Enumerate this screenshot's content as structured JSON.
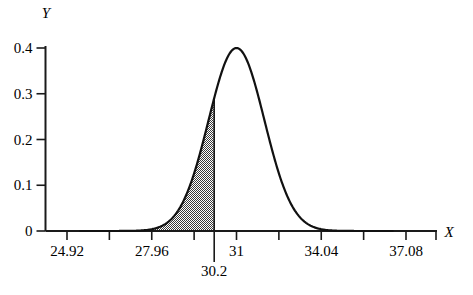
{
  "chart_data": {
    "type": "line",
    "title": "",
    "subtitle": "",
    "xlabel": "X",
    "ylabel": "Y",
    "xlim": [
      23.4,
      38.6
    ],
    "ylim": [
      0,
      0.42
    ],
    "grid": false,
    "legend": null,
    "x_tick_labels": [
      "24.92",
      "27.96",
      "31",
      "34.04",
      "37.08"
    ],
    "x_tick_values": [
      24.92,
      27.96,
      31,
      34.04,
      37.08
    ],
    "x_minor_ticks": [
      23.4,
      26.44,
      29.48,
      32.52,
      35.56,
      38.6
    ],
    "y_tick_labels": [
      "0",
      "0.1",
      "0.2",
      "0.3",
      "0.4"
    ],
    "y_tick_values": [
      0,
      0.1,
      0.2,
      0.3,
      0.4
    ],
    "series": [
      {
        "name": "normal density",
        "distribution": "normal",
        "mean": 31,
        "sigma": 1.0,
        "peak_x": 31,
        "peak_y": 0.4,
        "x": [
          26.5,
          27.0,
          27.5,
          28.0,
          28.5,
          29.0,
          29.5,
          30.0,
          30.2,
          30.5,
          31.0,
          31.5,
          32.0,
          32.5,
          33.0,
          33.5,
          34.0,
          34.5,
          35.0,
          35.5
        ],
        "values": [
          0.001,
          0.004,
          0.013,
          0.033,
          0.068,
          0.12,
          0.19,
          0.27,
          0.3,
          0.35,
          0.4,
          0.35,
          0.27,
          0.19,
          0.12,
          0.068,
          0.033,
          0.013,
          0.004,
          0.001
        ]
      }
    ],
    "shaded_region": {
      "label": "30.2",
      "from": 26.0,
      "to": 30.2,
      "boundary_x": 30.2,
      "boundary_y": 0.35,
      "fill": "hatched-gray",
      "fill_color": "#808080"
    },
    "annotations": [
      {
        "name": "boundary-marker",
        "text": "30.2",
        "x": 30.2,
        "y": 0
      }
    ]
  },
  "axes": {
    "x_axis_title": "X",
    "y_axis_title": "Y"
  },
  "colors": {
    "background": "#ffffff",
    "axis": "#1a1a1a",
    "curve": "#111111",
    "shade": "#8a8a8a",
    "text": "#1a1a1a"
  }
}
